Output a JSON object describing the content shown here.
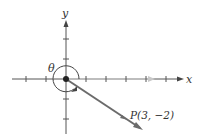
{
  "diagram": {
    "axes": {
      "x_label": "x",
      "y_label": "y"
    },
    "angle_label": "θ",
    "point_label": "P(3, −2)",
    "point": {
      "x": 3,
      "y": -2
    },
    "colors": {
      "axis": "#444444",
      "ray": "#6b6b6b",
      "positive_x_highlight": "#bfbfbf",
      "text": "#333333"
    }
  }
}
